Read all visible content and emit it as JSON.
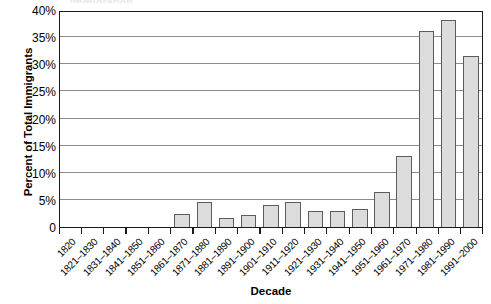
{
  "chart_data": {
    "type": "bar",
    "title": "",
    "xlabel": "Decade",
    "ylabel": "Percent of Total Immigrants",
    "ylim": [
      0,
      40
    ],
    "ytick_values": [
      0,
      5,
      10,
      15,
      20,
      25,
      30,
      35,
      40
    ],
    "ytick_labels": [
      "0",
      "5%",
      "10%",
      "15%",
      "20%",
      "25%",
      "30%",
      "35%",
      "40%"
    ],
    "grid": true,
    "legend": "none",
    "bar_fill_color": "#dcdcdc",
    "bar_border_color": "#5c5c5c",
    "gridline_color": "#8c8c8c",
    "axis_color": "#1a1a1a",
    "categories": [
      "1820",
      "1821–1830",
      "1831–1840",
      "1841–1850",
      "1851–1860",
      "1861–1870",
      "1871–1880",
      "1881–1890",
      "1891–1900",
      "1901–1910",
      "1911–1920",
      "1921–1930",
      "1931–1940",
      "1941–1950",
      "1951–1960",
      "1961–1970",
      "1971–1980",
      "1981–1990",
      "1991–2000"
    ],
    "values": [
      0,
      0,
      0,
      0,
      0,
      2.4,
      4.7,
      1.7,
      2.2,
      4.0,
      4.6,
      2.9,
      3.0,
      3.4,
      6.4,
      13.1,
      36.2,
      38.1,
      31.5
    ]
  },
  "y_axis": {
    "title": "Percent of Total Immigrants"
  },
  "x_axis": {
    "title": "Decade"
  },
  "clipped_header": {
    "text": "Immigration"
  }
}
